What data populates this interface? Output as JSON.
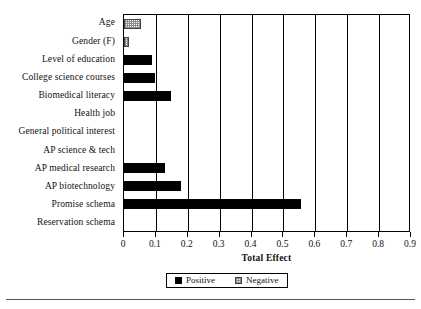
{
  "chart_data": {
    "type": "bar",
    "orientation": "horizontal",
    "title": "",
    "xlabel": "Total Effect",
    "ylabel": "",
    "xlim": [
      0,
      0.9
    ],
    "xticks": [
      0,
      0.1,
      0.2,
      0.3,
      0.4,
      0.5,
      0.6,
      0.7,
      0.8,
      0.9
    ],
    "xtick_labels": [
      "0",
      "0.1",
      "0.2",
      "0.3",
      "0.4",
      "0.5",
      "0.6",
      "0.7",
      "0.8",
      "0.9"
    ],
    "grid": "vertical",
    "legend_position": "bottom-center",
    "categories": [
      "Age",
      "Gender (F)",
      "Level of education",
      "College science courses",
      "Biomedical literacy",
      "Health job",
      "General political interest",
      "AP science & tech",
      "AP medical research",
      "AP biotechnology",
      "Promise schema",
      "Reservation schema"
    ],
    "values": [
      0.053,
      0.015,
      0.087,
      0.097,
      0.148,
      0.0,
      0.0,
      0.0,
      0.128,
      0.18,
      0.555,
      0.0
    ],
    "effect_signs": [
      "negative",
      "negative",
      "positive",
      "positive",
      "positive",
      "none",
      "none",
      "none",
      "positive",
      "positive",
      "positive",
      "none"
    ],
    "legend": [
      {
        "label": "Positive",
        "key": "positive",
        "color": "#000000"
      },
      {
        "label": "Negative",
        "key": "negative",
        "color": "#8a8a8a"
      }
    ]
  }
}
